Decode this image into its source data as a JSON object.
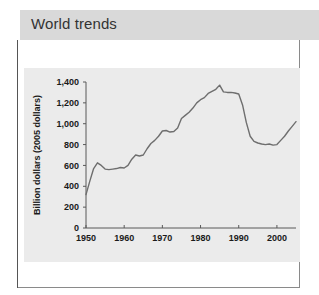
{
  "header": {
    "title": "World trends",
    "background_color": "#d9d9d9",
    "text_color": "#333333"
  },
  "panel": {
    "border_color": "#8a8a8a",
    "chart_background": "#ebebeb"
  },
  "chart_data": {
    "type": "line",
    "title": "",
    "subtitle": "",
    "xlabel": "",
    "ylabel": "Billion dollars (2005 dollars)",
    "xlim": [
      1950,
      2005
    ],
    "ylim": [
      0,
      1400
    ],
    "grid": false,
    "legend": false,
    "line_color": "#6e6e6e",
    "axis_color": "#595959",
    "xticks": [
      1950,
      1960,
      1970,
      1980,
      1990,
      2000
    ],
    "xtick_labels": [
      "1950",
      "1960",
      "1970",
      "1980",
      "1990",
      "2000"
    ],
    "yticks": [
      0,
      200,
      400,
      600,
      800,
      1000,
      1200,
      1400
    ],
    "ytick_labels": [
      "0",
      "200",
      "400",
      "600",
      "800",
      "1,000",
      "1,200",
      "1,400"
    ],
    "series": [
      {
        "name": "World trends",
        "x": [
          1950,
          1951,
          1952,
          1953,
          1954,
          1955,
          1956,
          1957,
          1958,
          1959,
          1960,
          1961,
          1962,
          1963,
          1964,
          1965,
          1966,
          1967,
          1968,
          1969,
          1970,
          1971,
          1972,
          1973,
          1974,
          1975,
          1976,
          1977,
          1978,
          1979,
          1980,
          1981,
          1982,
          1983,
          1984,
          1985,
          1986,
          1987,
          1988,
          1989,
          1990,
          1991,
          1992,
          1993,
          1994,
          1995,
          1996,
          1997,
          1998,
          1999,
          2000,
          2001,
          2002,
          2003,
          2004,
          2005
        ],
        "values": [
          320,
          450,
          570,
          625,
          600,
          565,
          560,
          565,
          570,
          580,
          575,
          600,
          660,
          700,
          690,
          700,
          760,
          810,
          840,
          880,
          930,
          935,
          920,
          925,
          960,
          1050,
          1080,
          1110,
          1150,
          1200,
          1230,
          1250,
          1290,
          1310,
          1330,
          1370,
          1305,
          1300,
          1300,
          1295,
          1285,
          1180,
          1010,
          880,
          830,
          815,
          805,
          800,
          805,
          795,
          800,
          840,
          880,
          930,
          975,
          1020
        ]
      }
    ]
  }
}
